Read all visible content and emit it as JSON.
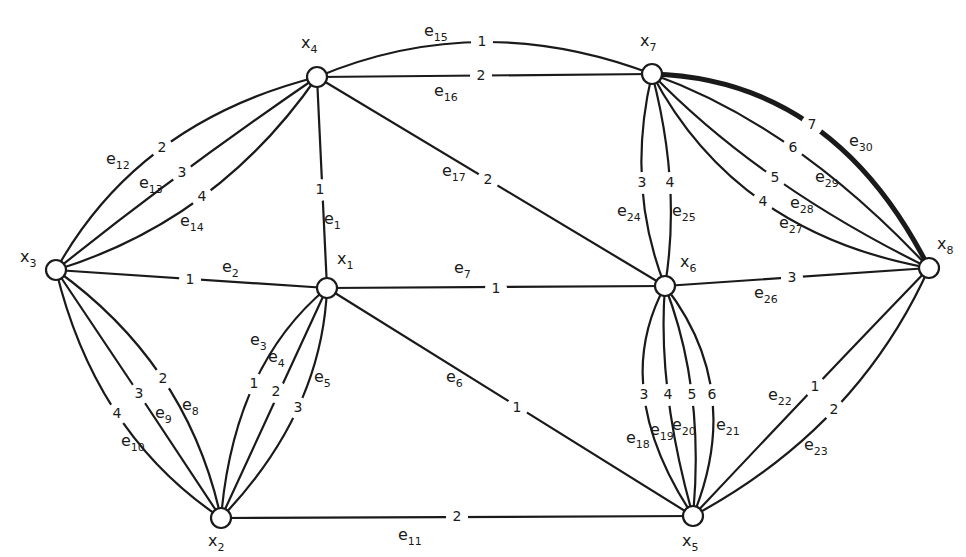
{
  "graph": {
    "title": "",
    "nodes": [
      {
        "id": "x1",
        "label": "x",
        "sub": "1",
        "x": 327,
        "y": 288,
        "lx": 337,
        "ly": 264
      },
      {
        "id": "x2",
        "label": "x",
        "sub": "2",
        "x": 221,
        "y": 518,
        "lx": 208,
        "ly": 546
      },
      {
        "id": "x3",
        "label": "x",
        "sub": "3",
        "x": 56,
        "y": 270,
        "lx": 20,
        "ly": 262
      },
      {
        "id": "x4",
        "label": "x",
        "sub": "4",
        "x": 317,
        "y": 77,
        "lx": 301,
        "ly": 48
      },
      {
        "id": "x5",
        "label": "x",
        "sub": "5",
        "x": 693,
        "y": 516,
        "lx": 682,
        "ly": 546
      },
      {
        "id": "x6",
        "label": "x",
        "sub": "6",
        "x": 665,
        "y": 286,
        "lx": 680,
        "ly": 267
      },
      {
        "id": "x7",
        "label": "x",
        "sub": "7",
        "x": 652,
        "y": 74,
        "lx": 640,
        "ly": 46
      },
      {
        "id": "x8",
        "label": "x",
        "sub": "8",
        "x": 929,
        "y": 268,
        "lx": 937,
        "ly": 249
      }
    ],
    "edges": [
      {
        "id": "e1",
        "from": "x4",
        "to": "x1",
        "weight": "1",
        "bend": 0,
        "wx": 320,
        "wy": 190,
        "lx": 324,
        "ly": 224,
        "bold": false
      },
      {
        "id": "e2",
        "from": "x3",
        "to": "x1",
        "weight": "1",
        "bend": 0,
        "wx": 190,
        "wy": 280,
        "lx": 222,
        "ly": 272,
        "bold": false
      },
      {
        "id": "e3",
        "from": "x1",
        "to": "x2",
        "weight": "1",
        "bend": -14,
        "wx": 254,
        "wy": 384,
        "lx": 250,
        "ly": 345,
        "bold": false
      },
      {
        "id": "e4",
        "from": "x1",
        "to": "x2",
        "weight": "2",
        "bend": 0,
        "wx": 276,
        "wy": 392,
        "lx": 268,
        "ly": 362,
        "bold": false
      },
      {
        "id": "e5",
        "from": "x1",
        "to": "x2",
        "weight": "3",
        "bend": 14,
        "wx": 298,
        "wy": 408,
        "lx": 314,
        "ly": 382,
        "bold": false
      },
      {
        "id": "e6",
        "from": "x1",
        "to": "x5",
        "weight": "1",
        "bend": 0,
        "wx": 517,
        "wy": 408,
        "lx": 446,
        "ly": 382,
        "bold": false
      },
      {
        "id": "e7",
        "from": "x1",
        "to": "x6",
        "weight": "1",
        "bend": 0,
        "wx": 496,
        "wy": 289,
        "lx": 454,
        "ly": 273,
        "bold": false
      },
      {
        "id": "e8",
        "from": "x3",
        "to": "x2",
        "weight": "2",
        "bend": -8,
        "wx": 163,
        "wy": 379,
        "lx": 182,
        "ly": 410,
        "bold": false
      },
      {
        "id": "e9",
        "from": "x3",
        "to": "x2",
        "weight": "3",
        "bend": 6,
        "wx": 139,
        "wy": 394,
        "lx": 155,
        "ly": 418,
        "bold": false
      },
      {
        "id": "e10",
        "from": "x3",
        "to": "x2",
        "weight": "4",
        "bend": 22,
        "wx": 117,
        "wy": 414,
        "lx": 121,
        "ly": 446,
        "bold": false
      },
      {
        "id": "e11",
        "from": "x2",
        "to": "x5",
        "weight": "2",
        "bend": 0,
        "wx": 457,
        "wy": 517,
        "lx": 398,
        "ly": 540,
        "bold": false
      },
      {
        "id": "e12",
        "from": "x3",
        "to": "x4",
        "weight": "2",
        "bend": -44,
        "wx": 162,
        "wy": 148,
        "lx": 106,
        "ly": 164,
        "bold": false
      },
      {
        "id": "e13",
        "from": "x3",
        "to": "x4",
        "weight": "3",
        "bend": -16,
        "wx": 182,
        "wy": 173,
        "lx": 139,
        "ly": 188,
        "bold": false
      },
      {
        "id": "e14",
        "from": "x3",
        "to": "x4",
        "weight": "4",
        "bend": 10,
        "wx": 202,
        "wy": 197,
        "lx": 180,
        "ly": 226,
        "bold": false
      },
      {
        "id": "e15",
        "from": "x4",
        "to": "x7",
        "weight": "1",
        "bend": -38,
        "wx": 482,
        "wy": 42,
        "lx": 424,
        "ly": 36,
        "bold": false
      },
      {
        "id": "e16",
        "from": "x4",
        "to": "x7",
        "weight": "2",
        "bend": 0,
        "wx": 481,
        "wy": 76,
        "lx": 434,
        "ly": 96,
        "bold": false
      },
      {
        "id": "e17",
        "from": "x4",
        "to": "x6",
        "weight": "2",
        "bend": 0,
        "wx": 488,
        "wy": 180,
        "lx": 442,
        "ly": 176,
        "bold": false
      },
      {
        "id": "e18",
        "from": "x6",
        "to": "x5",
        "weight": "3",
        "bend": 12,
        "wx": 644,
        "wy": 395,
        "lx": 626,
        "ly": 443,
        "bold": false
      },
      {
        "id": "e19",
        "from": "x6",
        "to": "x5",
        "weight": "4",
        "bend": 2,
        "wx": 668,
        "wy": 395,
        "lx": 650,
        "ly": 435,
        "bold": false
      },
      {
        "id": "e20",
        "from": "x6",
        "to": "x5",
        "weight": "5",
        "bend": -8,
        "wx": 692,
        "wy": 395,
        "lx": 672,
        "ly": 430,
        "bold": false
      },
      {
        "id": "e21",
        "from": "x6",
        "to": "x5",
        "weight": "6",
        "bend": -18,
        "wx": 712,
        "wy": 395,
        "lx": 716,
        "ly": 430,
        "bold": false
      },
      {
        "id": "e22",
        "from": "x5",
        "to": "x8",
        "weight": "1",
        "bend": 16,
        "wx": 815,
        "wy": 387,
        "lx": 768,
        "ly": 400,
        "bold": false
      },
      {
        "id": "e23",
        "from": "x5",
        "to": "x8",
        "weight": "2",
        "bend": -14,
        "wx": 834,
        "wy": 410,
        "lx": 804,
        "ly": 450,
        "bold": false
      },
      {
        "id": "e24",
        "from": "x7",
        "to": "x6",
        "weight": "3",
        "bend": 16,
        "wx": 642,
        "wy": 183,
        "lx": 617,
        "ly": 216,
        "bold": false
      },
      {
        "id": "e25",
        "from": "x7",
        "to": "x6",
        "weight": "4",
        "bend": -8,
        "wx": 670,
        "wy": 183,
        "lx": 672,
        "ly": 216,
        "bold": false
      },
      {
        "id": "e26",
        "from": "x6",
        "to": "x8",
        "weight": "3",
        "bend": 0,
        "wx": 792,
        "wy": 278,
        "lx": 754,
        "ly": 298,
        "bold": false
      },
      {
        "id": "e27",
        "from": "x7",
        "to": "x8",
        "weight": "4",
        "bend": 32,
        "wx": 763,
        "wy": 202,
        "lx": 779,
        "ly": 228,
        "bold": false
      },
      {
        "id": "e28",
        "from": "x7",
        "to": "x8",
        "weight": "5",
        "bend": 14,
        "wx": 775,
        "wy": 178,
        "lx": 790,
        "ly": 208,
        "bold": false
      },
      {
        "id": "e29",
        "from": "x7",
        "to": "x8",
        "weight": "6",
        "bend": -6,
        "wx": 793,
        "wy": 148,
        "lx": 815,
        "ly": 182,
        "bold": false
      },
      {
        "id": "e30",
        "from": "x7",
        "to": "x8",
        "weight": "7",
        "bend": -30,
        "wx": 812,
        "wy": 125,
        "lx": 849,
        "ly": 146,
        "bold": true
      }
    ]
  },
  "colors": {
    "ink": "#1a1a1a",
    "background": "#ffffff"
  }
}
